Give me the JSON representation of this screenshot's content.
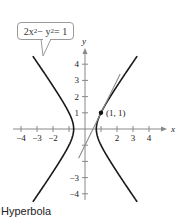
{
  "chart_data": {
    "type": "line",
    "title": "",
    "caption": "Hyperbola",
    "equation": {
      "lhs_parts": [
        "2x",
        "2",
        " − y",
        "2",
        " = 1"
      ],
      "display": "2x² − y² = 1"
    },
    "xlabel": "x",
    "ylabel": "y",
    "xlim": [
      -4.5,
      4.5
    ],
    "ylim": [
      -4.5,
      4.5
    ],
    "x_ticks": [
      -4,
      -3,
      -2,
      -1,
      1,
      2,
      3,
      4
    ],
    "x_tick_labels": [
      "−4",
      "−3",
      "−2",
      "",
      "",
      "2",
      "3",
      "4"
    ],
    "y_ticks": [
      -4,
      -3,
      -2,
      -1,
      1,
      2,
      3,
      4
    ],
    "y_tick_labels": [
      "−4",
      "−3",
      "",
      "",
      "1",
      "2",
      "3",
      "4"
    ],
    "grid": false,
    "series": [
      {
        "name": "2x² − y² = 1 (right branch)",
        "kind": "hyperbola",
        "equation": "2x^2 - y^2 = 1",
        "branch": "right",
        "y_range": [
          -4.5,
          4.5
        ],
        "color": "#1a1a1a"
      },
      {
        "name": "2x² − y² = 1 (left branch)",
        "kind": "hyperbola",
        "equation": "2x^2 - y^2 = 1",
        "branch": "left",
        "y_range": [
          -4.5,
          4.5
        ],
        "color": "#1a1a1a"
      },
      {
        "name": "Tangent line at (1, 1)",
        "kind": "line",
        "equation": "y = 2x - 1",
        "x_range": [
          -0.4,
          2.2
        ],
        "color": "#8c8c8c"
      }
    ],
    "points": [
      {
        "x": 1,
        "y": 1,
        "label": "(1, 1)"
      }
    ]
  }
}
